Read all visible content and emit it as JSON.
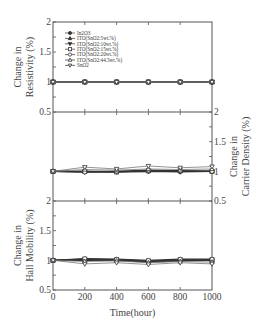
{
  "chart_data": {
    "type": "line",
    "layout": "three stacked panels sharing x-axis",
    "x": [
      0,
      200,
      400,
      600,
      800,
      1000
    ],
    "xlabel": "Time(hour)",
    "xticks": [
      "0",
      "200",
      "400",
      "600",
      "800",
      "1000"
    ],
    "xlim": [
      0,
      1000
    ],
    "legend": {
      "position": "upper-left of top panel",
      "entries": [
        {
          "label": "In2O3",
          "marker": "filled-circle"
        },
        {
          "label": "ITO(SnO2:5wt.%)",
          "marker": "filled-triangle-up"
        },
        {
          "label": "ITO(SnO2:10wt.%)",
          "marker": "filled-triangle-down"
        },
        {
          "label": "ITO(SnO2:15wt.%)",
          "marker": "open-square"
        },
        {
          "label": "ITO(SnO2:20wt.%)",
          "marker": "open-circle"
        },
        {
          "label": "ITO(SnO2:44.5wt.%)",
          "marker": "open-triangle-up"
        },
        {
          "label": "SnO2",
          "marker": "open-triangle-down"
        }
      ]
    },
    "panels": [
      {
        "name": "resistivity",
        "ylabel_line1": "Change in",
        "ylabel_line2": "Resistivity (%)",
        "axis_side": "left",
        "ylim": [
          0.5,
          2
        ],
        "yticks": [
          "2",
          "1.5",
          "1",
          "0.5"
        ],
        "series": [
          {
            "name": "In2O3",
            "values": [
              1,
              1,
              1,
              1,
              1,
              1
            ]
          },
          {
            "name": "ITO(SnO2:5wt.%)",
            "values": [
              1,
              1,
              1,
              1,
              1,
              1
            ]
          },
          {
            "name": "ITO(SnO2:10wt.%)",
            "values": [
              1,
              1,
              1,
              1,
              1,
              1
            ]
          },
          {
            "name": "ITO(SnO2:15wt.%)",
            "values": [
              1,
              1,
              1,
              1,
              1,
              1
            ]
          },
          {
            "name": "ITO(SnO2:20wt.%)",
            "values": [
              1,
              1,
              1,
              1,
              1,
              1
            ]
          },
          {
            "name": "ITO(SnO2:44.5wt.%)",
            "values": [
              1,
              1,
              1,
              1,
              1,
              1
            ]
          },
          {
            "name": "SnO2",
            "values": [
              1,
              1,
              1,
              1,
              1,
              1
            ]
          }
        ]
      },
      {
        "name": "carrier-density",
        "ylabel_line1": "Change in",
        "ylabel_line2": "Carrier Density (%)",
        "axis_side": "right",
        "ylim": [
          0.5,
          2
        ],
        "yticks": [
          "2",
          "1.5",
          "1",
          "0.5"
        ],
        "series": [
          {
            "name": "In2O3",
            "values": [
              1,
              0.99,
              0.99,
              1.0,
              1.0,
              1.0
            ]
          },
          {
            "name": "ITO(SnO2:5wt.%)",
            "values": [
              1,
              1.0,
              1.0,
              1.01,
              1.0,
              1.0
            ]
          },
          {
            "name": "ITO(SnO2:10wt.%)",
            "values": [
              1,
              0.99,
              0.99,
              1.0,
              0.99,
              1.0
            ]
          },
          {
            "name": "ITO(SnO2:15wt.%)",
            "values": [
              1,
              1.0,
              0.99,
              1.01,
              1.01,
              1.0
            ]
          },
          {
            "name": "ITO(SnO2:20wt.%)",
            "values": [
              1,
              0.99,
              1.0,
              1.02,
              1.01,
              1.0
            ]
          },
          {
            "name": "ITO(SnO2:44.5wt.%)",
            "values": [
              1,
              1.03,
              1.02,
              1.04,
              1.03,
              1.04
            ]
          },
          {
            "name": "SnO2",
            "values": [
              1,
              1.07,
              1.04,
              1.09,
              1.06,
              1.08
            ]
          }
        ]
      },
      {
        "name": "hall-mobility",
        "ylabel_line1": "Change in",
        "ylabel_line2": "Hall Mobility (%)",
        "axis_side": "left",
        "ylim": [
          0.5,
          2
        ],
        "yticks": [
          "2",
          "1.5",
          "1",
          "0.5"
        ],
        "series": [
          {
            "name": "In2O3",
            "values": [
              1,
              1.01,
              1.01,
              0.98,
              1.0,
              1.0
            ]
          },
          {
            "name": "ITO(SnO2:5wt.%)",
            "values": [
              1,
              1.01,
              1.0,
              0.98,
              1.0,
              1.0
            ]
          },
          {
            "name": "ITO(SnO2:10wt.%)",
            "values": [
              1,
              1.0,
              1.0,
              0.97,
              0.99,
              1.0
            ]
          },
          {
            "name": "ITO(SnO2:15wt.%)",
            "values": [
              1,
              1.02,
              1.01,
              0.99,
              1.01,
              1.01
            ]
          },
          {
            "name": "ITO(SnO2:20wt.%)",
            "values": [
              1,
              1.03,
              1.02,
              1.0,
              1.02,
              1.02
            ]
          },
          {
            "name": "ITO(SnO2:44.5wt.%)",
            "values": [
              1,
              0.98,
              0.99,
              0.96,
              0.98,
              0.97
            ]
          },
          {
            "name": "SnO2",
            "values": [
              1,
              0.94,
              0.96,
              0.93,
              0.96,
              0.94
            ]
          }
        ]
      }
    ]
  },
  "colors": {
    "frame": "#555555",
    "series_dark": "#333333",
    "series_light": "#777777"
  }
}
